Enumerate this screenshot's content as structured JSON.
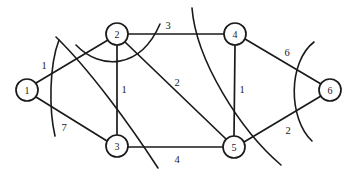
{
  "figure": {
    "kind": "weighted-undirected-graph-with-cuts",
    "width": 353,
    "height": 177,
    "background": "#ffffff",
    "ink_color": "#1a1a1a"
  },
  "nodes": [
    {
      "id": "1",
      "label": "1",
      "cx": 27,
      "cy": 90,
      "r": 11
    },
    {
      "id": "2",
      "label": "2",
      "cx": 117,
      "cy": 34,
      "r": 11
    },
    {
      "id": "3",
      "label": "3",
      "cx": 117,
      "cy": 146,
      "r": 11
    },
    {
      "id": "4",
      "label": "4",
      "cx": 235,
      "cy": 34,
      "r": 11
    },
    {
      "id": "5",
      "label": "5",
      "cx": 234,
      "cy": 147,
      "r": 11
    },
    {
      "id": "6",
      "label": "6",
      "cx": 330,
      "cy": 90,
      "r": 11
    }
  ],
  "edges": [
    {
      "id": "e-1-2",
      "from": "1",
      "to": "2",
      "weight": "1",
      "lx": 44,
      "ly": 65,
      "x1": 36,
      "y1": 83,
      "x2": 108,
      "y2": 40
    },
    {
      "id": "e-1-3",
      "from": "1",
      "to": "3",
      "weight": "7",
      "lx": 64,
      "ly": 127,
      "x1": 36,
      "y1": 97,
      "x2": 107,
      "y2": 141
    },
    {
      "id": "e-2-4",
      "from": "2",
      "to": "4",
      "weight": "3",
      "lx": 168,
      "ly": 25,
      "x1": 128,
      "y1": 34,
      "x2": 224,
      "y2": 34
    },
    {
      "id": "e-2-3",
      "from": "2",
      "to": "3",
      "weight": "1",
      "lx": 124,
      "ly": 89,
      "x1": 117,
      "y1": 45,
      "x2": 117,
      "y2": 135
    },
    {
      "id": "e-2-5",
      "from": "2",
      "to": "5",
      "weight": "2",
      "lx": 177,
      "ly": 82,
      "x1": 125,
      "y1": 42,
      "x2": 226,
      "y2": 139
    },
    {
      "id": "e-3-5",
      "from": "3",
      "to": "5",
      "weight": "4",
      "lx": 177,
      "ly": 159,
      "x1": 128,
      "y1": 147,
      "x2": 223,
      "y2": 147
    },
    {
      "id": "e-4-5",
      "from": "4",
      "to": "5",
      "weight": "1",
      "lx": 242,
      "ly": 89,
      "x1": 235,
      "y1": 45,
      "x2": 234,
      "y2": 136
    },
    {
      "id": "e-4-6",
      "from": "4",
      "to": "6",
      "weight": "6",
      "lx": 287,
      "ly": 52,
      "x1": 245,
      "y1": 39,
      "x2": 321,
      "y2": 84
    },
    {
      "id": "e-5-6",
      "from": "5",
      "to": "6",
      "weight": "2",
      "lx": 288,
      "ly": 130,
      "x1": 244,
      "y1": 142,
      "x2": 321,
      "y2": 96
    }
  ],
  "cuts": [
    {
      "id": "cut-left",
      "d": "M 59 40 C 49 66, 49 110, 55 136"
    },
    {
      "id": "cut-node2-under",
      "d": "M 76 45 C 100 70, 140 70, 160 24"
    },
    {
      "id": "cut-diagonal",
      "d": "M 56 37 C 90 70, 130 125, 158 168"
    },
    {
      "id": "cut-center",
      "d": "M 192 8 C 196 60, 240 130, 281 165"
    },
    {
      "id": "cut-right",
      "d": "M 314 42 C 288 62, 288 118, 312 141"
    }
  ],
  "labels": {
    "node_ids": [
      "1",
      "2",
      "3",
      "4",
      "5",
      "6"
    ],
    "weights": [
      "1",
      "7",
      "3",
      "1",
      "2",
      "4",
      "1",
      "6",
      "2"
    ]
  }
}
